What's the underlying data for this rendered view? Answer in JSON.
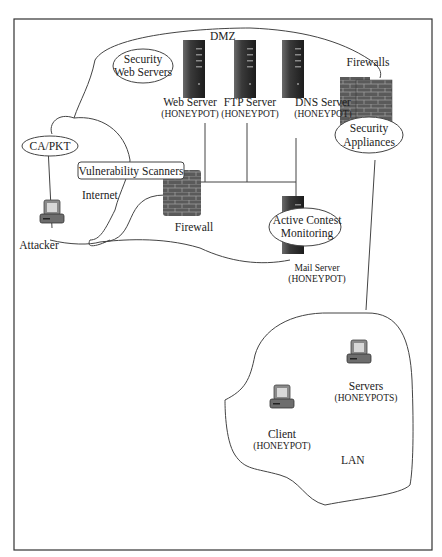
{
  "diagram": {
    "zones": {
      "dmz": "DMZ",
      "internet": "Internet",
      "lan": "LAN"
    },
    "callouts": {
      "security_web_servers": [
        "Security",
        "Web Servers"
      ],
      "ca_pkt": "CA/PKT",
      "vulnerability_scanners": "Vulnerability Scanners",
      "security_appliances": [
        "Security",
        "Appliances"
      ],
      "active_contest_monitoring": [
        "Active Contest",
        "Monitoring"
      ]
    },
    "nodes": {
      "web_server": {
        "name": "Web Server",
        "tag": "(HONEYPOT)"
      },
      "ftp_server": {
        "name": "FTP Server",
        "tag": "(HONEYPOT)"
      },
      "dns_server": {
        "name": "DNS Server",
        "tag": "(HONEYPOT)"
      },
      "mail_server": {
        "name": "Mail Server",
        "tag": "(HONEYPOT)"
      },
      "firewalls": {
        "name": "Firewalls"
      },
      "firewall": {
        "name": "Firewall"
      },
      "attacker": {
        "name": "Attacker"
      },
      "servers": {
        "name": "Servers",
        "tag": "(HONEYPOTS)"
      },
      "client": {
        "name": "Client",
        "tag": "(HONEYPOT)"
      }
    },
    "colors": {
      "server": "#2b2b2b",
      "firewall": "#555555",
      "brick_line": "#9a9a9a",
      "outline": "#444444"
    }
  }
}
